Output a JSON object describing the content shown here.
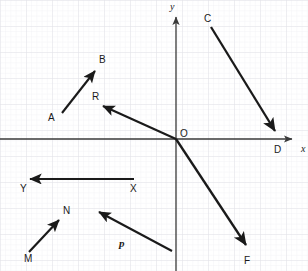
{
  "figure": {
    "width": 308,
    "height": 271,
    "background_color": "#ffffff",
    "ink_color": "#1a1a1a",
    "grid": {
      "minor_spacing_px": 5.2,
      "major_spacing_px": 26,
      "minor_color": "#eeeef2",
      "major_color": "#e0e0e6",
      "visible": true
    },
    "axes": {
      "origin": {
        "x": 176,
        "y": 139
      },
      "x_axis": {
        "from_x": 0,
        "to_x": 296,
        "y": 139,
        "arrow": "right",
        "label": "x",
        "label_x": 301,
        "label_y": 144
      },
      "y_axis": {
        "x": 176,
        "from_y": 271,
        "to_y": 13,
        "arrow": "up",
        "label": "y",
        "label_x": 170,
        "label_y": 2
      },
      "origin_label": "O",
      "origin_label_x": 180,
      "origin_label_y": 129
    },
    "vectors": [
      {
        "name": "AB",
        "tail_label": "A",
        "head_label": "B",
        "x1": 62,
        "y1": 113,
        "x2": 97,
        "y2": 68,
        "tail_label_x": 48,
        "tail_label_y": 113,
        "head_label_x": 99,
        "head_label_y": 55
      },
      {
        "name": "R",
        "tail_label": "",
        "head_label": "R",
        "x1": 176,
        "y1": 139,
        "x2": 100,
        "y2": 105,
        "tail_label_x": 0,
        "tail_label_y": 0,
        "head_label_x": 92,
        "head_label_y": 92
      },
      {
        "name": "CD",
        "tail_label": "C",
        "head_label": "D",
        "x1": 211,
        "y1": 27,
        "x2": 277,
        "y2": 134,
        "tail_label_x": 204,
        "tail_label_y": 14,
        "head_label_x": 274,
        "head_label_y": 145
      },
      {
        "name": "OF",
        "tail_label": "",
        "head_label": "F",
        "x1": 176,
        "y1": 139,
        "x2": 249,
        "y2": 249,
        "tail_label_x": 0,
        "tail_label_y": 0,
        "head_label_x": 244,
        "head_label_y": 256
      },
      {
        "name": "XY",
        "tail_label": "X",
        "head_label": "Y",
        "x1": 134,
        "y1": 179,
        "x2": 26,
        "y2": 179,
        "tail_label_x": 130,
        "tail_label_y": 184,
        "head_label_x": 20,
        "head_label_y": 184
      },
      {
        "name": "MN",
        "tail_label": "M",
        "head_label": "N",
        "x1": 29,
        "y1": 252,
        "x2": 61,
        "y2": 217,
        "tail_label_x": 24,
        "tail_label_y": 254,
        "head_label_x": 63,
        "head_label_y": 206
      },
      {
        "name": "P",
        "tail_label": "",
        "head_label": "",
        "x1": 172,
        "y1": 251,
        "x2": 95,
        "y2": 210,
        "tail_label_x": 0,
        "tail_label_y": 0,
        "head_label_x": 0,
        "head_label_y": 0
      }
    ],
    "standalone_labels": [
      {
        "text": "p",
        "x": 119,
        "y": 238,
        "style": "bold-italic-serif",
        "data_name": "vector-label-p"
      }
    ]
  }
}
